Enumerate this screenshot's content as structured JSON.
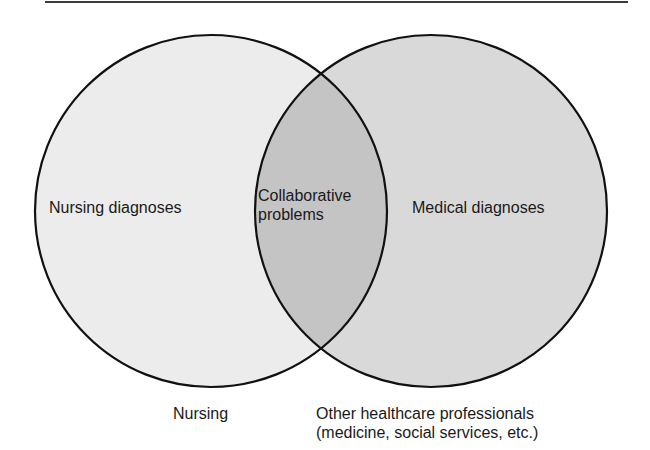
{
  "diagram": {
    "type": "venn",
    "sets": [
      {
        "id": "nursing",
        "inner_label": "Nursing diagnoses",
        "outer_label": "Nursing",
        "fill": "#ececec"
      },
      {
        "id": "other",
        "inner_label": "Medical diagnoses",
        "outer_label_lines": [
          "Other healthcare professionals",
          "(medicine, social services, etc.)"
        ],
        "fill": "#d9d9d9"
      }
    ],
    "intersection": {
      "label_lines": [
        "Collaborative",
        "problems"
      ],
      "fill": "#c4c4c4"
    },
    "stroke_color": "#111111"
  }
}
